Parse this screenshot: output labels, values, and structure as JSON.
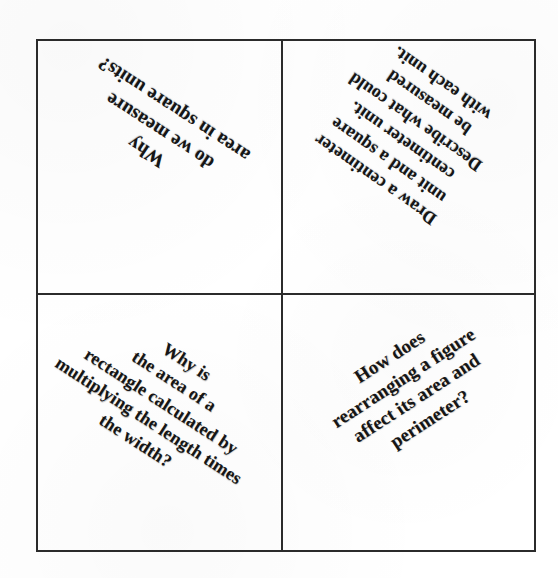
{
  "document": {
    "kind": "scanned-worksheet",
    "layout": "2x2-grid",
    "background_color": "#ffffff",
    "line_color": "#2b2b2b",
    "text_color": "#151515"
  },
  "grid": {
    "columns": 2,
    "rows": 2,
    "cells": [
      {
        "id": "top-left",
        "position": "top-left",
        "rotation_deg": 213,
        "text": "Why\ndo we measure\narea in square units?"
      },
      {
        "id": "top-right",
        "position": "top-right",
        "rotation_deg": 215,
        "text": "Draw a centimeter\nunit and  a square\ncentimeter unit.\nDescribe what could\nbe measured\nwith each unit."
      },
      {
        "id": "bottom-left",
        "position": "bottom-left",
        "rotation_deg": 33,
        "text": "Why is\nthe area of a\nrectangle calculated by\nmultiplying the length times\nthe width?"
      },
      {
        "id": "bottom-right",
        "position": "bottom-right",
        "rotation_deg": -33,
        "text": "How does\nrearranging a figure\naffect its area and perimeter?"
      }
    ]
  }
}
